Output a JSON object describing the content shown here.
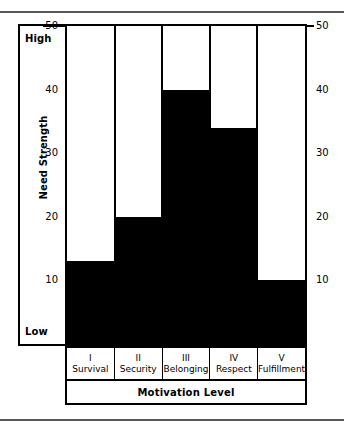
{
  "chart_data": {
    "type": "bar",
    "title": "",
    "xlabel": "Motivation Level",
    "ylabel": "Need Strength",
    "categories": [
      "Survival",
      "Security",
      "Belonging",
      "Respect",
      "Fulfillment"
    ],
    "category_numerals": [
      "I",
      "II",
      "III",
      "IV",
      "V"
    ],
    "values": [
      13,
      20,
      40,
      34,
      10
    ],
    "ylim": [
      0,
      50
    ],
    "yticks": [
      10,
      20,
      30,
      40,
      50
    ],
    "ytick_labels": [
      "10",
      "20",
      "30",
      "40",
      "50"
    ],
    "y_axis_low_label": "Low",
    "y_axis_high_label": "High",
    "grid": false,
    "legend": "none",
    "bar_color": "#000000",
    "plot_background": "#ffffff",
    "axis_color": "#000000",
    "duplicate_right_axis": true
  },
  "figure": {
    "rule_color": "#58585a",
    "frame_color": "#000000"
  }
}
